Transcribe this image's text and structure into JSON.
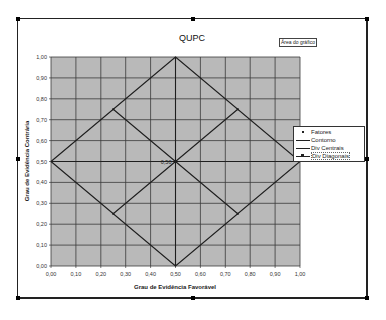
{
  "chart_data": {
    "type": "line",
    "title": "QUPC",
    "xlabel": "Grau de Evidência Favorável",
    "ylabel": "Grau de Evidência Contrária",
    "xlim": [
      0,
      1
    ],
    "ylim": [
      0,
      1
    ],
    "grid": true,
    "legend_position": "right",
    "x_ticks": [
      "0,00",
      "0,10",
      "0,20",
      "0,30",
      "0,40",
      "0,50",
      "0,60",
      "0,70",
      "0,80",
      "0,90",
      "1,00"
    ],
    "y_ticks": [
      "0,00",
      "0,10",
      "0,20",
      "0,30",
      "0,40",
      "0,50",
      "0,60",
      "0,70",
      "0,80",
      "0,90",
      "1,00"
    ],
    "series": [
      {
        "name": "Fatores",
        "style": "marker",
        "points": [
          [
            0.5,
            0.5
          ]
        ],
        "labels": [
          "0,50"
        ]
      },
      {
        "name": "Contorno",
        "style": "line",
        "points": [
          [
            0,
            0.5
          ],
          [
            0.5,
            1
          ],
          [
            1,
            0.5
          ],
          [
            0.5,
            0
          ],
          [
            0,
            0.5
          ]
        ]
      },
      {
        "name": "Div Centrais",
        "style": "line",
        "segments": [
          [
            [
              0,
              0.5
            ],
            [
              1,
              0.5
            ]
          ],
          [
            [
              0.5,
              0
            ],
            [
              0.5,
              1
            ]
          ]
        ]
      },
      {
        "name": "Div Diagonais",
        "style": "line-marker",
        "segments": [
          [
            [
              0.25,
              0.75
            ],
            [
              0.5,
              0.5
            ],
            [
              0.75,
              0.25
            ]
          ],
          [
            [
              0.25,
              0.25
            ],
            [
              0.5,
              0.5
            ],
            [
              0.75,
              0.75
            ]
          ]
        ]
      }
    ],
    "annotations": [
      "Área do gráfico",
      "0,50"
    ]
  },
  "ui": {
    "area_tag": "Área do gráfico",
    "colors": {
      "plot_bg": "#b9b9b9",
      "grid": "#3a3a3a",
      "line": "#1e1e1e",
      "chart_bg": "#ffffff"
    }
  },
  "legend": {
    "items": [
      {
        "label": "Fatores"
      },
      {
        "label": "Contorno"
      },
      {
        "label": "Div Centrais"
      },
      {
        "label": "Div Diagonais"
      }
    ]
  }
}
